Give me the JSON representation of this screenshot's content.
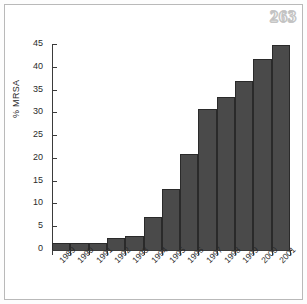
{
  "page": {
    "number": "263"
  },
  "chart_data": {
    "type": "bar",
    "title": "",
    "xlabel": "",
    "ylabel": "% MRSA",
    "categories": [
      "1989",
      "1990",
      "1991",
      "1992",
      "1993",
      "1994",
      "1995",
      "1996",
      "1997",
      "1998",
      "1999",
      "2000",
      "2001"
    ],
    "values": [
      1.5,
      1.5,
      1.5,
      2.6,
      3.1,
      7.2,
      13.5,
      21.0,
      31.0,
      33.5,
      37.0,
      42.0,
      45.0
    ],
    "ylim": [
      0,
      45
    ],
    "yticks": [
      0,
      5,
      10,
      15,
      20,
      25,
      30,
      35,
      40,
      45
    ],
    "ytick_labels": [
      "0",
      "5",
      "10",
      "15",
      "20",
      "25",
      "30",
      "35",
      "40",
      "45"
    ],
    "grid": false,
    "legend": null,
    "bar_color": "#4a4a4a",
    "axis_color": "#3b3b3b"
  }
}
